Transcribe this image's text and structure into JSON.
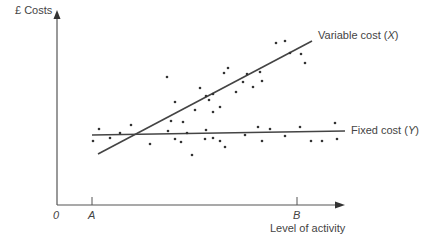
{
  "chart_data": {
    "type": "scatter",
    "title": "",
    "ylabel": "£ Costs",
    "xlabel": "Level of activity",
    "origin_label": "0",
    "x_markers": [
      {
        "label": "A",
        "x_px": 92
      },
      {
        "label": "B",
        "x_px": 297
      }
    ],
    "grid": false,
    "legend": "inline line labels",
    "axes": {
      "origin": [
        57,
        205
      ],
      "y_top": 10,
      "x_right": 345
    },
    "series": [
      {
        "name": "Variable cost (X)",
        "kind": "line",
        "label": "Variable cost",
        "var": "X",
        "line": [
          [
            98,
            154
          ],
          [
            312,
            41
          ]
        ],
        "points": [
          [
            167,
            77
          ],
          [
            175,
            102
          ],
          [
            171,
            121
          ],
          [
            183,
            122
          ],
          [
            187,
            133
          ],
          [
            195,
            110
          ],
          [
            200,
            88
          ],
          [
            206,
            96
          ],
          [
            209,
            100
          ],
          [
            213,
            94
          ],
          [
            220,
            107
          ],
          [
            224,
            73
          ],
          [
            228,
            68
          ],
          [
            236,
            92
          ],
          [
            243,
            82
          ],
          [
            247,
            74
          ],
          [
            253,
            87
          ],
          [
            260,
            72
          ],
          [
            262,
            81
          ],
          [
            276,
            43
          ],
          [
            285,
            41
          ],
          [
            290,
            53
          ],
          [
            301,
            54
          ],
          [
            305,
            63
          ],
          [
            213,
            112
          ]
        ]
      },
      {
        "name": "Fixed cost (Y)",
        "kind": "line",
        "label": "Fixed cost",
        "var": "Y",
        "line": [
          [
            92,
            135
          ],
          [
            345,
            131
          ]
        ],
        "points": [
          [
            93,
            141
          ],
          [
            99,
            129
          ],
          [
            110,
            138
          ],
          [
            120,
            133
          ],
          [
            131,
            125
          ],
          [
            150,
            144
          ],
          [
            168,
            131
          ],
          [
            175,
            139
          ],
          [
            181,
            142
          ],
          [
            192,
            155
          ],
          [
            206,
            130
          ],
          [
            213,
            138
          ],
          [
            220,
            141
          ],
          [
            225,
            147
          ],
          [
            245,
            135
          ],
          [
            258,
            127
          ],
          [
            262,
            141
          ],
          [
            270,
            129
          ],
          [
            285,
            136
          ],
          [
            300,
            127
          ],
          [
            311,
            141
          ],
          [
            322,
            141
          ],
          [
            335,
            123
          ],
          [
            337,
            139
          ],
          [
            205,
            139
          ]
        ]
      }
    ]
  }
}
